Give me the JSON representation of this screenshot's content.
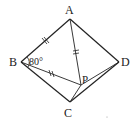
{
  "diagram": {
    "points": {
      "A": {
        "label": "A",
        "x": 70,
        "y": 19
      },
      "B": {
        "label": "B",
        "x": 21,
        "y": 62
      },
      "C": {
        "label": "C",
        "x": 70,
        "y": 102
      },
      "D": {
        "label": "D",
        "x": 119,
        "y": 62
      },
      "P": {
        "label": "P",
        "x": 81,
        "y": 85
      }
    },
    "angle_label": "80°",
    "segments": [
      "AB",
      "AD",
      "BC",
      "CD",
      "AP",
      "BP",
      "CP",
      "DP"
    ],
    "equal_marks": [
      "AB",
      "AP",
      "BP"
    ],
    "stroke_color": "#222222"
  }
}
